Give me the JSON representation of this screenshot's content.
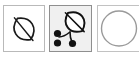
{
  "strip": {
    "name": "botanical-icon-strip",
    "background_color": "#ffffff",
    "panel_count": 3
  },
  "panels": [
    {
      "id": "leaf",
      "label": "leaf",
      "icon_name": "leaf-icon",
      "selected": false,
      "background_color": "#ffffff",
      "border_color": "#b9b9b9",
      "stroke_color": "#1a1a1a"
    },
    {
      "id": "leaf-berries",
      "label": "leaf with berries",
      "icon_name": "leaf-berries-icon",
      "selected": true,
      "background_color": "#f0f0f0",
      "border_color": "#8f8f8f",
      "stroke_color": "#111111",
      "berry_count": 3
    },
    {
      "id": "circle",
      "label": "circle",
      "icon_name": "circle-icon",
      "selected": false,
      "background_color": "#ffffff",
      "border_color": "#c2c2c2",
      "stroke_color": "#9a9a9a",
      "clipped": true
    }
  ]
}
